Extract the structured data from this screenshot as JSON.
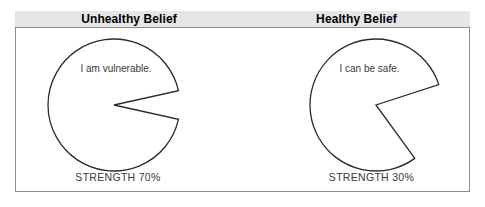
{
  "header": {
    "left_title": "Unhealthy Belief",
    "right_title": "Healthy Belief",
    "band_color": "#e6e6e6"
  },
  "frame": {
    "border_color": "#8c8c8c",
    "background": "#ffffff"
  },
  "chart_data": {
    "type": "pie",
    "title": "",
    "legend": "none",
    "charts": [
      {
        "id": "unhealthy-belief-pie",
        "label": "Unhealthy Belief",
        "belief_text": "I am vulnerable.",
        "strength_label": "STRENGTH 70%",
        "strength_percent": 70,
        "categories": [
          "Belief strength",
          "Remaining"
        ],
        "values": [
          93,
          7
        ],
        "removed_wedge_degrees": 25,
        "wedge_center_angle_degrees": 0,
        "stroke_color": "#2b2b2b",
        "fill_color": "#ffffff"
      },
      {
        "id": "healthy-belief-pie",
        "label": "Healthy Belief",
        "belief_text": "I can be safe.",
        "strength_label": "STRENGTH 30%",
        "strength_percent": 30,
        "categories": [
          "Belief strength",
          "Remaining"
        ],
        "values": [
          80,
          20
        ],
        "removed_wedge_degrees": 72,
        "wedge_center_angle_degrees": 18,
        "stroke_color": "#2b2b2b",
        "fill_color": "#ffffff"
      }
    ]
  }
}
